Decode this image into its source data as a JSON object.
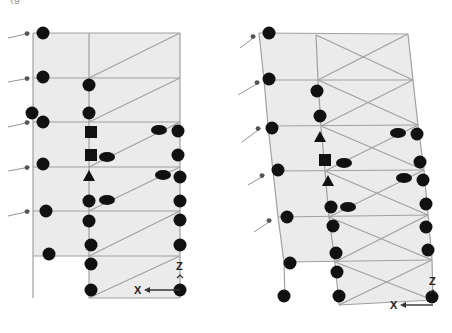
{
  "caption": "(g",
  "colors": {
    "panel_fill": "#ebebeb",
    "line": "#a0a0a0",
    "hinge": "#111111",
    "background": "#ffffff"
  },
  "legend_symbols": {
    "circle": "plastic-hinge-circle",
    "square": "hinge-square",
    "triangle": "hinge-triangle",
    "ellipse": "hinge-ellipse"
  },
  "frames": [
    {
      "name": "left-frame",
      "axis": {
        "x_label": "X",
        "z_label": "Z",
        "origin": [
          180,
          290
        ],
        "arrow_to": [
          146,
          290
        ]
      },
      "panels": [
        [
          [
            33,
            33
          ],
          [
            180,
            33
          ],
          [
            180,
            256
          ],
          [
            89,
            256
          ],
          [
            89,
            298
          ],
          [
            180,
            298
          ],
          [
            180,
            256
          ],
          [
            33,
            256
          ]
        ]
      ],
      "lines": [
        [
          33,
          33,
          180,
          33
        ],
        [
          33,
          78,
          180,
          78
        ],
        [
          33,
          122,
          180,
          122
        ],
        [
          33,
          167,
          180,
          167
        ],
        [
          33,
          211,
          180,
          211
        ],
        [
          33,
          256,
          180,
          256
        ],
        [
          89,
          298,
          180,
          298
        ],
        [
          33,
          33,
          33,
          298
        ],
        [
          89,
          33,
          89,
          298
        ],
        [
          180,
          33,
          180,
          298
        ],
        [
          89,
          78,
          180,
          33
        ],
        [
          89,
          122,
          180,
          78
        ],
        [
          89,
          167,
          180,
          122
        ],
        [
          89,
          211,
          180,
          167
        ],
        [
          89,
          256,
          180,
          211
        ],
        [
          89,
          298,
          180,
          256
        ]
      ],
      "load_arrows": [
        [
          8,
          38,
          30,
          33
        ],
        [
          8,
          82,
          30,
          78
        ],
        [
          8,
          127,
          30,
          122
        ],
        [
          8,
          171,
          30,
          167
        ],
        [
          8,
          216,
          30,
          211
        ]
      ],
      "hinges": [
        {
          "shape": "circle",
          "x": 43,
          "y": 33
        },
        {
          "shape": "circle",
          "x": 43,
          "y": 77
        },
        {
          "shape": "circle",
          "x": 32,
          "y": 113
        },
        {
          "shape": "circle",
          "x": 43,
          "y": 122
        },
        {
          "shape": "circle",
          "x": 43,
          "y": 164
        },
        {
          "shape": "circle",
          "x": 46,
          "y": 211
        },
        {
          "shape": "circle",
          "x": 49,
          "y": 254
        },
        {
          "shape": "circle",
          "x": 89,
          "y": 85
        },
        {
          "shape": "circle",
          "x": 89,
          "y": 113
        },
        {
          "shape": "square",
          "x": 91,
          "y": 132
        },
        {
          "shape": "square",
          "x": 91,
          "y": 155
        },
        {
          "shape": "ellipse",
          "x": 107,
          "y": 157
        },
        {
          "shape": "triangle",
          "x": 89,
          "y": 176
        },
        {
          "shape": "circle",
          "x": 89,
          "y": 201
        },
        {
          "shape": "ellipse",
          "x": 107,
          "y": 200
        },
        {
          "shape": "circle",
          "x": 89,
          "y": 221
        },
        {
          "shape": "circle",
          "x": 91,
          "y": 245
        },
        {
          "shape": "circle",
          "x": 91,
          "y": 264
        },
        {
          "shape": "circle",
          "x": 91,
          "y": 290
        },
        {
          "shape": "ellipse",
          "x": 159,
          "y": 130
        },
        {
          "shape": "circle",
          "x": 178,
          "y": 131
        },
        {
          "shape": "circle",
          "x": 178,
          "y": 155
        },
        {
          "shape": "ellipse",
          "x": 163,
          "y": 175
        },
        {
          "shape": "circle",
          "x": 180,
          "y": 177
        },
        {
          "shape": "circle",
          "x": 180,
          "y": 201
        },
        {
          "shape": "circle",
          "x": 180,
          "y": 220
        },
        {
          "shape": "circle",
          "x": 180,
          "y": 245
        },
        {
          "shape": "circle",
          "x": 180,
          "y": 290
        }
      ]
    },
    {
      "name": "right-frame",
      "axis": {
        "x_label": "X",
        "z_label": "Z",
        "origin": [
          433,
          305
        ],
        "arrow_to": [
          402,
          305
        ]
      },
      "panels": [
        [
          [
            259,
            33
          ],
          [
            408,
            34
          ],
          [
            413,
            80
          ],
          [
            418,
            125
          ],
          [
            424,
            170
          ],
          [
            428,
            215
          ],
          [
            432,
            260
          ],
          [
            433,
            300
          ],
          [
            339,
            305
          ],
          [
            337,
            262
          ],
          [
            284,
            262
          ],
          [
            278,
            217
          ],
          [
            273,
            171
          ],
          [
            268,
            126
          ],
          [
            264,
            80
          ]
        ]
      ],
      "lines": [
        [
          259,
          33,
          408,
          34
        ],
        [
          264,
          80,
          413,
          80
        ],
        [
          268,
          126,
          418,
          125
        ],
        [
          273,
          171,
          424,
          170
        ],
        [
          278,
          217,
          428,
          215
        ],
        [
          284,
          262,
          432,
          260
        ],
        [
          339,
          305,
          433,
          300
        ],
        [
          259,
          33,
          264,
          80
        ],
        [
          264,
          80,
          268,
          126
        ],
        [
          268,
          126,
          273,
          171
        ],
        [
          273,
          171,
          278,
          217
        ],
        [
          278,
          217,
          284,
          262
        ],
        [
          284,
          262,
          285,
          298
        ],
        [
          316,
          35,
          318,
          80
        ],
        [
          318,
          80,
          321,
          126
        ],
        [
          321,
          126,
          325,
          171
        ],
        [
          325,
          171,
          329,
          217
        ],
        [
          329,
          217,
          335,
          262
        ],
        [
          335,
          262,
          339,
          305
        ],
        [
          408,
          34,
          413,
          80
        ],
        [
          413,
          80,
          418,
          125
        ],
        [
          418,
          125,
          424,
          170
        ],
        [
          424,
          170,
          428,
          215
        ],
        [
          428,
          215,
          432,
          260
        ],
        [
          432,
          260,
          433,
          300
        ],
        [
          316,
          35,
          413,
          80
        ],
        [
          318,
          80,
          408,
          34
        ],
        [
          318,
          80,
          418,
          125
        ],
        [
          321,
          126,
          413,
          80
        ],
        [
          321,
          126,
          424,
          170
        ],
        [
          325,
          171,
          418,
          125
        ],
        [
          325,
          171,
          428,
          215
        ],
        [
          329,
          217,
          424,
          170
        ],
        [
          329,
          217,
          432,
          260
        ],
        [
          335,
          262,
          428,
          215
        ],
        [
          335,
          262,
          433,
          300
        ],
        [
          339,
          305,
          432,
          260
        ]
      ],
      "load_arrows": [
        [
          240,
          48,
          256,
          36
        ],
        [
          238,
          95,
          260,
          82
        ],
        [
          242,
          142,
          261,
          128
        ],
        [
          248,
          185,
          265,
          175
        ],
        [
          254,
          232,
          272,
          220
        ]
      ],
      "hinges": [
        {
          "shape": "circle",
          "x": 269,
          "y": 33
        },
        {
          "shape": "circle",
          "x": 269,
          "y": 79
        },
        {
          "shape": "circle",
          "x": 272,
          "y": 128
        },
        {
          "shape": "circle",
          "x": 278,
          "y": 170
        },
        {
          "shape": "circle",
          "x": 287,
          "y": 217
        },
        {
          "shape": "circle",
          "x": 290,
          "y": 263
        },
        {
          "shape": "circle",
          "x": 284,
          "y": 296
        },
        {
          "shape": "circle",
          "x": 317,
          "y": 91
        },
        {
          "shape": "circle",
          "x": 320,
          "y": 116
        },
        {
          "shape": "triangle",
          "x": 320,
          "y": 137
        },
        {
          "shape": "square",
          "x": 325,
          "y": 160
        },
        {
          "shape": "ellipse",
          "x": 344,
          "y": 163
        },
        {
          "shape": "triangle",
          "x": 328,
          "y": 181
        },
        {
          "shape": "circle",
          "x": 331,
          "y": 207
        },
        {
          "shape": "ellipse",
          "x": 348,
          "y": 207
        },
        {
          "shape": "circle",
          "x": 333,
          "y": 226
        },
        {
          "shape": "circle",
          "x": 336,
          "y": 253
        },
        {
          "shape": "circle",
          "x": 337,
          "y": 272
        },
        {
          "shape": "circle",
          "x": 339,
          "y": 296
        },
        {
          "shape": "ellipse",
          "x": 398,
          "y": 133
        },
        {
          "shape": "circle",
          "x": 417,
          "y": 134
        },
        {
          "shape": "circle",
          "x": 420,
          "y": 162
        },
        {
          "shape": "ellipse",
          "x": 404,
          "y": 178
        },
        {
          "shape": "circle",
          "x": 423,
          "y": 180
        },
        {
          "shape": "circle",
          "x": 426,
          "y": 204
        },
        {
          "shape": "circle",
          "x": 426,
          "y": 227
        },
        {
          "shape": "circle",
          "x": 428,
          "y": 250
        },
        {
          "shape": "circle",
          "x": 432,
          "y": 297
        }
      ]
    }
  ]
}
